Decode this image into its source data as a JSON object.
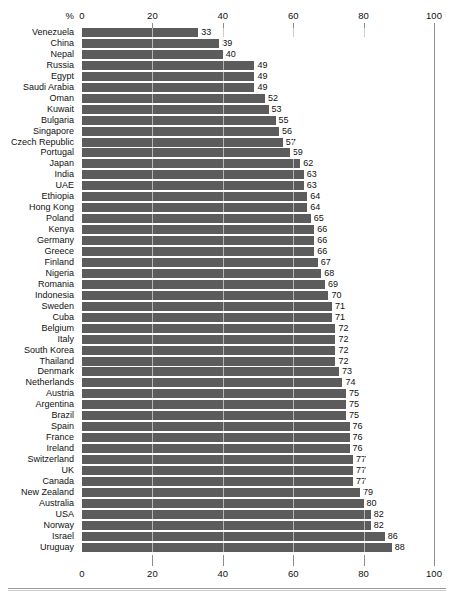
{
  "chart_data": {
    "type": "bar",
    "orientation": "horizontal",
    "title": "",
    "subtitle": "",
    "xlabel": "",
    "ylabel": "",
    "unit_label": "%",
    "xlim": [
      0,
      100
    ],
    "xticks": [
      0,
      20,
      40,
      60,
      80,
      100
    ],
    "xtick_labels": [
      "0",
      "20",
      "40",
      "60",
      "80",
      "100"
    ],
    "grid": true,
    "legend": "none",
    "bar_color": "#5c5c5c",
    "background_color": "#ffffff",
    "text_color": "#111111",
    "axis_color": "#8d8d8d",
    "categories": [
      "Venezuela",
      "China",
      "Nepal",
      "Russia",
      "Egypt",
      "Saudi Arabia",
      "Oman",
      "Kuwait",
      "Bulgaria",
      "Singapore",
      "Czech Republic",
      "Portugal",
      "Japan",
      "India",
      "UAE",
      "Ethiopia",
      "Hong Kong",
      "Poland",
      "Kenya",
      "Germany",
      "Greece",
      "Finland",
      "Nigeria",
      "Romania",
      "Indonesia",
      "Sweden",
      "Cuba",
      "Belgium",
      "Italy",
      "South Korea",
      "Thailand",
      "Denmark",
      "Netherlands",
      "Austria",
      "Argentina",
      "Brazil",
      "Spain",
      "France",
      "Ireland",
      "Switzerland",
      "UK",
      "Canada",
      "New Zealand",
      "Australia",
      "USA",
      "Norway",
      "Israel",
      "Uruguay"
    ],
    "values": [
      33,
      39,
      40,
      49,
      49,
      49,
      52,
      53,
      55,
      56,
      57,
      59,
      62,
      63,
      63,
      64,
      64,
      65,
      66,
      66,
      66,
      67,
      68,
      69,
      70,
      71,
      71,
      72,
      72,
      72,
      72,
      73,
      74,
      75,
      75,
      75,
      76,
      76,
      76,
      77,
      77,
      77,
      79,
      80,
      82,
      82,
      86,
      88
    ],
    "value_labels": [
      "33",
      "39",
      "40",
      "49",
      "49",
      "49",
      "52",
      "53",
      "55",
      "56",
      "57",
      "59",
      "62",
      "63",
      "63",
      "64",
      "64",
      "65",
      "66",
      "66",
      "66",
      "67",
      "68",
      "69",
      "70",
      "71",
      "71",
      "72",
      "72",
      "72",
      "72",
      "73",
      "74",
      "75",
      "75",
      "75",
      "76",
      "76",
      "76",
      "77",
      "77",
      "77",
      "79",
      "80",
      "82",
      "82",
      "86",
      "88"
    ],
    "visible_value_labels": [
      "33",
      "39",
      "40",
      "49",
      "49",
      "52",
      "53",
      "55",
      "56",
      "57",
      "59",
      "62",
      "63",
      "63",
      "64",
      "64",
      "65",
      "66",
      "66",
      "66",
      "67",
      "68",
      "69",
      "70",
      "71",
      "71",
      "72",
      "72",
      "72",
      "72",
      "73",
      "74",
      "75",
      "75",
      "75",
      "76",
      "76",
      "76",
      "77",
      "77",
      "77",
      "79",
      "80",
      "82",
      "82",
      "86",
      "88",
      "88"
    ]
  }
}
